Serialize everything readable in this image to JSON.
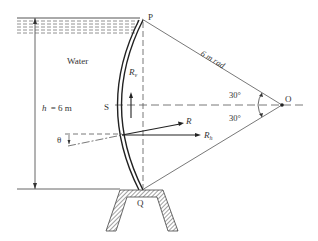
{
  "diagram": {
    "colors": {
      "line": "#333333",
      "dash": "#444444",
      "background": "#ffffff"
    },
    "labels": {
      "water": "Water",
      "depth": "h = 6 m",
      "depth_var": "h",
      "depth_value": "= 6 m",
      "radius": "6 m rad",
      "point_p": "P",
      "point_q": "Q",
      "point_s": "S",
      "point_o": "O",
      "angle_upper": "30°",
      "angle_lower": "30°",
      "theta": "θ",
      "resultant": "R",
      "vertical_force": "R",
      "vertical_force_sub": "v",
      "horizontal_force": "R",
      "horizontal_force_sub": "h"
    },
    "geometry": {
      "gate_radius_m": 6,
      "depth_m": 6,
      "half_angle_deg": 30
    }
  }
}
